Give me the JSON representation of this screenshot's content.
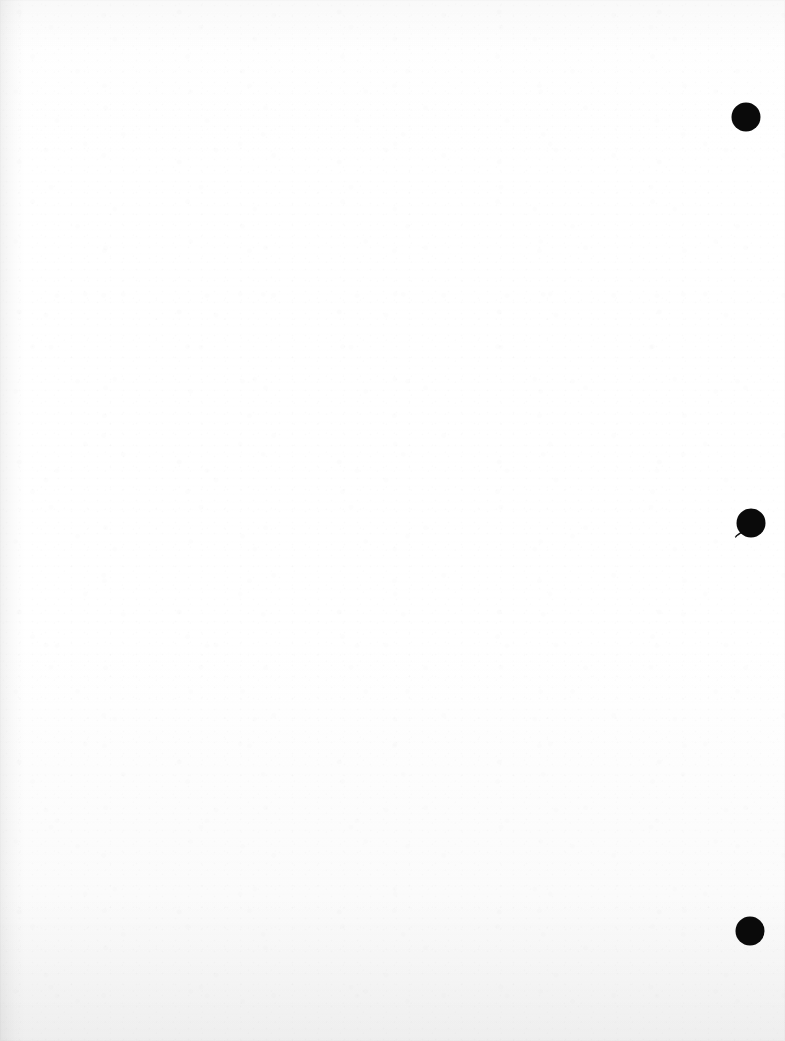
{
  "document": {
    "kind": "scanned-page",
    "page_label": "",
    "body_text": "",
    "width": 785,
    "height": 1041
  },
  "appearance": {
    "paper_color": "#fdfdfd",
    "ink_color": "#0a0a0a",
    "gutter_side": "left"
  },
  "margin_marks": {
    "label": "margin marks",
    "side": "right",
    "count": 3,
    "items": [
      {
        "name": "margin-dot-top",
        "shape": "filled-circle",
        "cx": 746,
        "cy": 117,
        "r": 14.5,
        "color": "#0a0a0a",
        "has_tail": false
      },
      {
        "name": "margin-dot-middle",
        "shape": "filled-circle-with-tail",
        "cx": 751,
        "cy": 523,
        "r": 14.5,
        "color": "#0a0a0a",
        "has_tail": true,
        "tail_direction": "lower-left"
      },
      {
        "name": "margin-dot-bottom",
        "shape": "filled-circle",
        "cx": 750,
        "cy": 931,
        "r": 14.5,
        "color": "#0a0a0a",
        "has_tail": false
      }
    ]
  }
}
